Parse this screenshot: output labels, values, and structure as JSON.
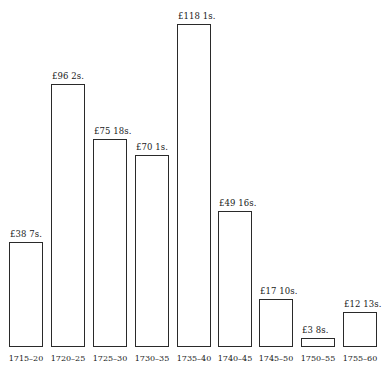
{
  "chart_data": {
    "type": "bar",
    "title": "",
    "xlabel": "",
    "ylabel": "",
    "grid": false,
    "legend": null,
    "categories": [
      "1715–20",
      "1720–25",
      "1725–30",
      "1730–35",
      "1735–40",
      "1740–45",
      "1745–50",
      "1750–55",
      "1755–60"
    ],
    "value_labels": [
      "£38 7s.",
      "£96 2s.",
      "£75 18s.",
      "£70 1s.",
      "£118 1s.",
      "£49 16s.",
      "£17 10s.",
      "£3 8s.",
      "£12 13s."
    ],
    "values": [
      38.35,
      96.1,
      75.9,
      70.05,
      118.05,
      49.8,
      17.5,
      3.4,
      12.65
    ],
    "ylim": [
      0,
      120
    ]
  },
  "layout": {
    "baseline": 347,
    "px_per_pound": 2.74,
    "bar_width": 34,
    "bar_lefts": [
      9,
      51,
      93,
      135,
      177,
      218,
      259,
      301,
      343
    ]
  }
}
